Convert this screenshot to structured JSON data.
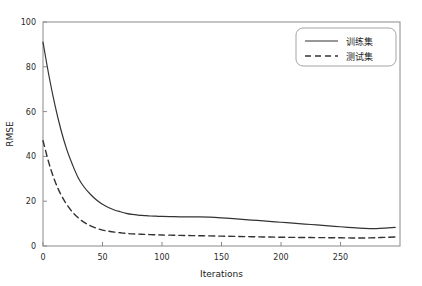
{
  "chart_data": {
    "type": "line",
    "title": "",
    "xlabel": "Iterations",
    "ylabel": "RMSE",
    "xlim": [
      0,
      300
    ],
    "ylim": [
      0,
      100
    ],
    "xticks": [
      0,
      50,
      100,
      150,
      200,
      250
    ],
    "yticks": [
      0,
      20,
      40,
      60,
      80,
      100
    ],
    "xtick_labels": [
      "0",
      "50",
      "100",
      "150",
      "200",
      "250"
    ],
    "ytick_labels": [
      "0",
      "20",
      "40",
      "60",
      "80",
      "100"
    ],
    "grid": false,
    "legend_position": "upper right",
    "legend": [
      "训练集",
      "测试集"
    ],
    "x": [
      0,
      5,
      10,
      15,
      20,
      25,
      30,
      35,
      40,
      45,
      50,
      55,
      60,
      65,
      70,
      75,
      80,
      85,
      90,
      95,
      100,
      110,
      120,
      130,
      140,
      150,
      160,
      170,
      180,
      190,
      200,
      210,
      220,
      230,
      240,
      250,
      260,
      270,
      280,
      290,
      296
    ],
    "series": [
      {
        "name": "训练集",
        "style": "solid",
        "color": "#333333",
        "values": [
          91,
          76,
          63,
          52,
          43,
          36,
          30,
          26,
          23,
          20.5,
          18.6,
          17.2,
          16.1,
          15.3,
          14.6,
          14.1,
          13.8,
          13.6,
          13.4,
          13.3,
          13.2,
          13.1,
          13.0,
          13.0,
          12.9,
          12.6,
          12.2,
          11.8,
          11.4,
          11.0,
          10.6,
          10.2,
          9.8,
          9.4,
          9.0,
          8.6,
          8.2,
          7.9,
          7.8,
          8.1,
          8.3
        ]
      },
      {
        "name": "测试集",
        "style": "dashed",
        "color": "#333333",
        "values": [
          47,
          37,
          29,
          23,
          18.5,
          15,
          12.4,
          10.4,
          9.0,
          7.9,
          7.1,
          6.6,
          6.2,
          5.9,
          5.6,
          5.4,
          5.3,
          5.2,
          5.1,
          5.0,
          4.9,
          4.8,
          4.7,
          4.6,
          4.5,
          4.4,
          4.3,
          4.2,
          4.1,
          4.0,
          3.9,
          3.85,
          3.8,
          3.75,
          3.7,
          3.65,
          3.6,
          3.6,
          3.7,
          3.9,
          4.0
        ]
      }
    ]
  }
}
